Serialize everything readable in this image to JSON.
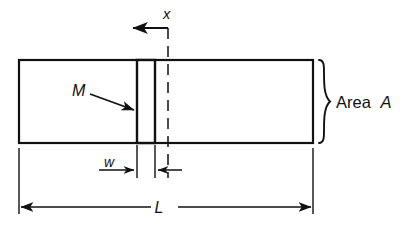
{
  "figure": {
    "type": "engineering-diagram",
    "background_color": "#ffffff",
    "line_color": "#111111"
  },
  "labels": {
    "axis_x": "x",
    "mass_m": "M",
    "width_w": "w",
    "length_l": "L",
    "area_text": "Area",
    "area_symbol": "A"
  },
  "geometry": {
    "bar": {
      "left": 19,
      "top": 60,
      "right": 313,
      "bottom": 143
    },
    "slice": {
      "left": 137,
      "top": 60,
      "right": 155,
      "bottom": 143
    },
    "centerline_x": 168,
    "centerline_top": 28,
    "centerline_bottom": 178,
    "axis_arrow_y": 28,
    "axis_arrow_tip_x": 131,
    "w_dimension_y": 170,
    "l_dimension_y": 207
  },
  "annotations": [
    {
      "name": "x-axis-arrow",
      "label": "x",
      "direction": "left",
      "description": "coordinate axis pointing left from section centerline"
    },
    {
      "name": "mass-leader",
      "label": "M",
      "direction": "down-right",
      "description": "leader arrow pointing to left face of differential slice"
    },
    {
      "name": "width-dimension",
      "label": "w",
      "description": "width of the differential slice element"
    },
    {
      "name": "length-dimension",
      "label": "L",
      "description": "overall length of the bar"
    },
    {
      "name": "area-brace",
      "label": "Area A",
      "description": "right-side curly brace denoting cross-sectional area"
    }
  ]
}
